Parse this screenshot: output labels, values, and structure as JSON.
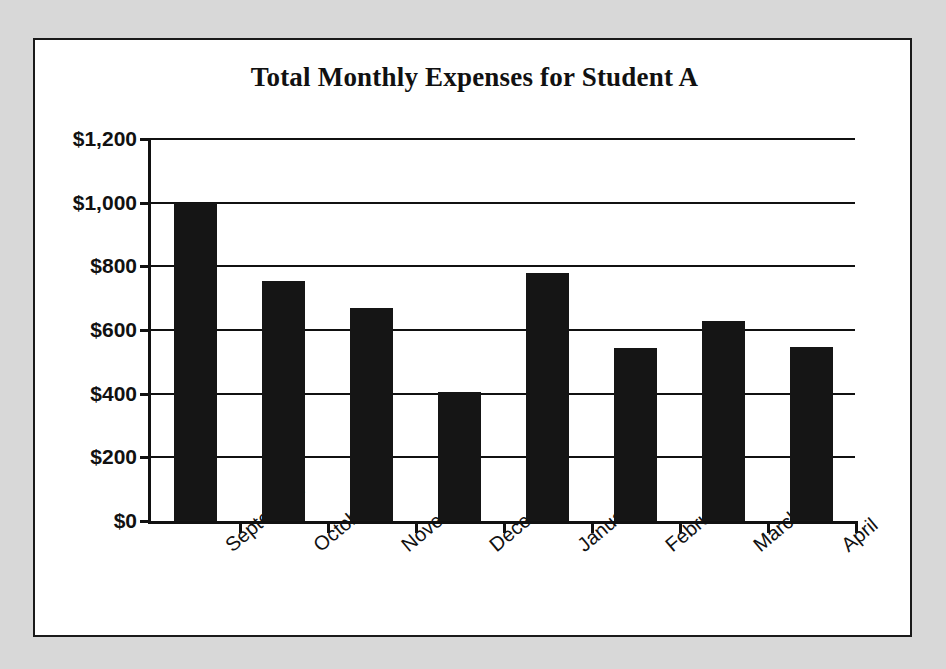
{
  "figure": {
    "background_color": "#d8d8d8",
    "paper_color": "#ffffff",
    "frame_color": "#1a1a1a"
  },
  "chart_data": {
    "type": "bar",
    "title": "Total Monthly Expenses for Student A",
    "xlabel": "",
    "ylabel": "",
    "categories": [
      "September",
      "October",
      "November",
      "December",
      "January",
      "February",
      "March",
      "April"
    ],
    "values": [
      1000,
      755,
      670,
      405,
      780,
      543,
      628,
      547
    ],
    "ylim": [
      0,
      1200
    ],
    "ytick_values": [
      0,
      200,
      400,
      600,
      800,
      1000,
      1200
    ],
    "ytick_labels": [
      "$0",
      "$200",
      "$400",
      "$600",
      "$800",
      "$1,000",
      "$1,200"
    ],
    "grid": true,
    "legend": null,
    "bar_color": "#151515",
    "axis_color": "#111111",
    "currency": "USD"
  }
}
